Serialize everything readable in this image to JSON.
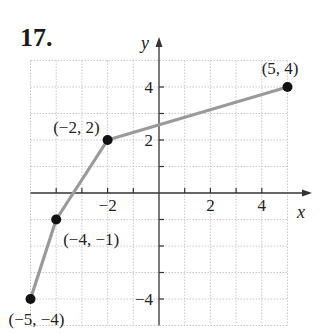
{
  "problem_number": "17.",
  "chart_data": {
    "type": "line",
    "title": "",
    "xlabel": "x",
    "ylabel": "y",
    "xlim": [
      -5,
      5
    ],
    "ylim": [
      -5,
      5
    ],
    "grid": true,
    "x_ticks": [
      -4,
      -3,
      -2,
      -1,
      1,
      2,
      3,
      4
    ],
    "y_ticks": [
      -4,
      -3,
      -2,
      -1,
      1,
      2,
      3,
      4
    ],
    "x_tick_labels": [
      {
        "value": -2,
        "text": "−2"
      },
      {
        "value": 2,
        "text": "2"
      },
      {
        "value": 4,
        "text": "4"
      }
    ],
    "y_tick_labels": [
      {
        "value": 4,
        "text": "4"
      },
      {
        "value": 2,
        "text": "2"
      },
      {
        "value": -4,
        "text": "−4"
      }
    ],
    "series": [
      {
        "name": "piecewise linear",
        "x": [
          -5,
          -4,
          -2,
          5
        ],
        "y": [
          -4,
          -1,
          2,
          4
        ],
        "color": "#9a9a9a"
      }
    ],
    "points": [
      {
        "x": -5,
        "y": -4,
        "label": "(−5, −4)"
      },
      {
        "x": -4,
        "y": -1,
        "label": "(−4, −1)"
      },
      {
        "x": -2,
        "y": 2,
        "label": "(−2, 2)"
      },
      {
        "x": 5,
        "y": 4,
        "label": "(5, 4)"
      }
    ]
  }
}
